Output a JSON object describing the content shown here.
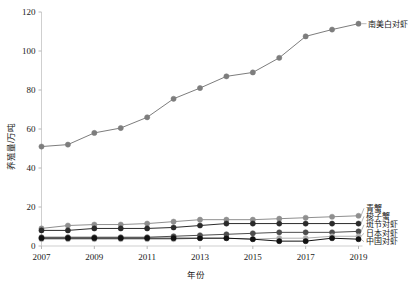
{
  "chart_data": {
    "type": "line",
    "title": "",
    "xlabel": "年份",
    "ylabel": "养殖量/万吨",
    "x": [
      2007,
      2008,
      2009,
      2010,
      2011,
      2012,
      2013,
      2014,
      2015,
      2016,
      2017,
      2018,
      2019
    ],
    "xlim": [
      2007,
      2019
    ],
    "ylim": [
      0,
      120
    ],
    "xticks": [
      2007,
      2009,
      2011,
      2013,
      2015,
      2017,
      2019
    ],
    "xtick_labels": [
      "2007",
      "2009",
      "2011",
      "2013",
      "2015",
      "2017",
      "2019"
    ],
    "yticks": [
      0,
      20,
      40,
      60,
      80,
      100,
      120
    ],
    "ytick_labels": [
      "0",
      "20",
      "40",
      "60",
      "80",
      "100",
      "120"
    ],
    "grid": false,
    "legend_position": "right-inline-labels",
    "series": [
      {
        "name": "南美白对虾",
        "color": "#7d7d7d",
        "marker": "circle",
        "values": [
          51.0,
          52.0,
          58.0,
          60.5,
          66.0,
          75.5,
          81.0,
          87.0,
          89.0,
          96.5,
          107.5,
          111.0,
          114.0
        ]
      },
      {
        "name": "青蟹",
        "color": "#8f8f8f",
        "marker": "circle",
        "values": [
          9.0,
          10.5,
          11.0,
          11.0,
          11.5,
          12.5,
          13.5,
          13.5,
          13.5,
          14.0,
          14.5,
          15.0,
          15.5
        ]
      },
      {
        "name": "梭子蟹",
        "color": "#2b2b2b",
        "marker": "circle",
        "values": [
          8.0,
          8.0,
          9.0,
          9.0,
          9.0,
          9.5,
          10.5,
          11.5,
          11.5,
          11.5,
          11.5,
          11.5,
          11.5
        ]
      },
      {
        "name": "斑节对虾",
        "color": "#4d4d4d",
        "marker": "circle",
        "values": [
          4.5,
          4.5,
          4.5,
          4.5,
          4.5,
          5.0,
          5.5,
          6.0,
          6.5,
          7.0,
          7.0,
          7.0,
          7.5
        ]
      },
      {
        "name": "日本对虾",
        "color": "#b0b0b0",
        "marker": "circle",
        "values": [
          3.5,
          3.5,
          3.5,
          3.5,
          3.5,
          3.5,
          4.0,
          4.0,
          3.5,
          4.0,
          4.0,
          5.0,
          5.0
        ]
      },
      {
        "name": "中国对虾",
        "color": "#111111",
        "marker": "circle",
        "values": [
          4.0,
          4.0,
          4.0,
          4.0,
          4.0,
          4.0,
          4.0,
          4.0,
          3.5,
          2.5,
          2.5,
          4.0,
          3.5
        ]
      }
    ]
  },
  "annotations": {
    "top_series_label": "南美白对虾"
  }
}
